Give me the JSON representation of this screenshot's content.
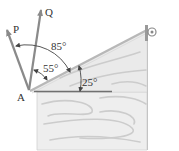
{
  "diagram": {
    "type": "statics-force-diagram",
    "point_label": "A",
    "forces": [
      {
        "name": "P",
        "label": "P"
      },
      {
        "name": "Q",
        "label": "Q"
      }
    ],
    "angles": {
      "between_P_and_incline": "85°",
      "between_Q_and_incline": "55°",
      "incline_to_horizontal": "25°"
    },
    "colors": {
      "arrow": "#8a8a8a",
      "wood_fill": "#ececec",
      "wood_grain": "#c8c8c8",
      "outline": "#a8a8a8",
      "dimension_line": "#555555",
      "reference_line": "#6e6e6e",
      "text": "#333333"
    }
  }
}
